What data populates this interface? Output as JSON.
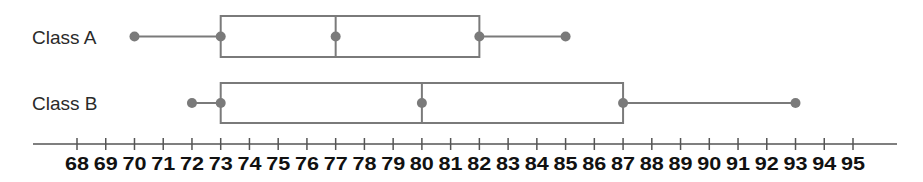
{
  "chart_data": {
    "type": "boxplot",
    "title": "",
    "xlabel": "",
    "ylabel": "",
    "xlim": [
      68,
      95
    ],
    "grid": false,
    "legend": null,
    "ticks": [
      68,
      69,
      70,
      71,
      72,
      73,
      74,
      75,
      76,
      77,
      78,
      79,
      80,
      81,
      82,
      83,
      84,
      85,
      86,
      87,
      88,
      89,
      90,
      91,
      92,
      93,
      94,
      95
    ],
    "series": [
      {
        "name": "Class A",
        "min": 70,
        "q1": 73,
        "median": 77,
        "q3": 82,
        "max": 85
      },
      {
        "name": "Class B",
        "min": 72,
        "q1": 73,
        "median": 80,
        "q3": 87,
        "max": 93
      }
    ]
  },
  "colors": {
    "box_stroke": "#7a7a7a",
    "point": "#7a7a7a",
    "axis": "#555555",
    "label": "#2a2a2a"
  }
}
